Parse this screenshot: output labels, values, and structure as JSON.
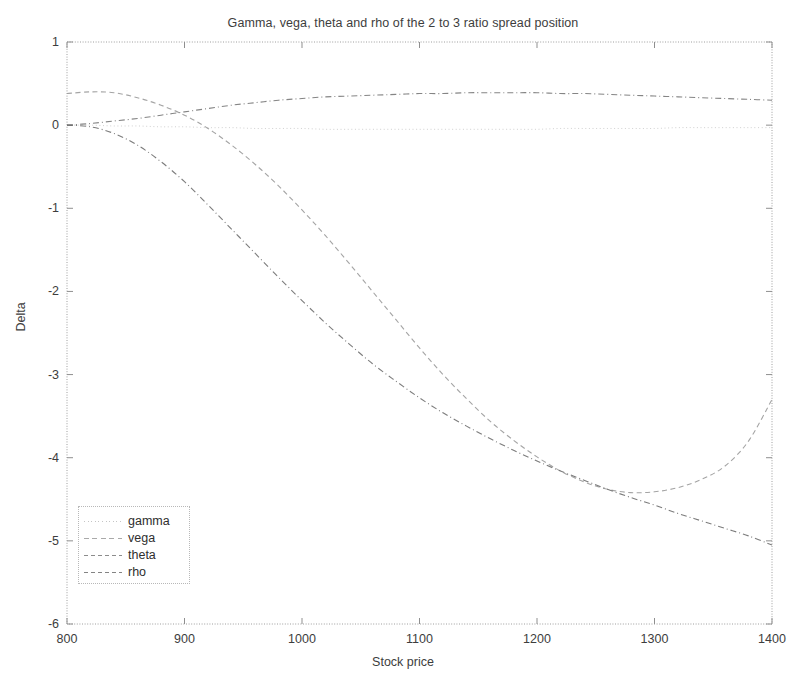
{
  "chart_data": {
    "type": "line",
    "title": "Gamma, vega, theta and rho of the 2 to 3 ratio spread position",
    "xlabel": "Stock price",
    "ylabel": "Delta",
    "xlim": [
      800,
      1400
    ],
    "ylim": [
      -6,
      1
    ],
    "xticks": [
      800,
      900,
      1000,
      1100,
      1200,
      1300,
      1400
    ],
    "yticks": [
      1,
      0,
      -1,
      -2,
      -3,
      -4,
      -5,
      -6
    ],
    "grid": false,
    "legend_position": "lower left",
    "x": [
      800,
      820,
      840,
      860,
      880,
      900,
      920,
      940,
      960,
      980,
      1000,
      1020,
      1040,
      1060,
      1080,
      1100,
      1120,
      1140,
      1160,
      1180,
      1200,
      1220,
      1240,
      1260,
      1280,
      1300,
      1320,
      1340,
      1360,
      1380,
      1400
    ],
    "series": [
      {
        "name": "gamma",
        "style": "dotted",
        "color": "#8a8a8a",
        "values": [
          0.0,
          0.0,
          -0.01,
          -0.01,
          -0.02,
          -0.02,
          -0.03,
          -0.03,
          -0.04,
          -0.04,
          -0.04,
          -0.05,
          -0.05,
          -0.05,
          -0.05,
          -0.05,
          -0.05,
          -0.05,
          -0.05,
          -0.05,
          -0.05,
          -0.04,
          -0.04,
          -0.04,
          -0.04,
          -0.04,
          -0.03,
          -0.03,
          -0.03,
          -0.03,
          -0.03
        ]
      },
      {
        "name": "vega",
        "style": "dashed",
        "color": "#9a9a9a",
        "values": [
          0.38,
          0.4,
          0.39,
          0.33,
          0.24,
          0.12,
          -0.04,
          -0.24,
          -0.47,
          -0.73,
          -1.02,
          -1.33,
          -1.66,
          -2.0,
          -2.34,
          -2.68,
          -3.0,
          -3.29,
          -3.56,
          -3.79,
          -3.99,
          -4.16,
          -4.29,
          -4.38,
          -4.42,
          -4.41,
          -4.36,
          -4.26,
          -4.1,
          -3.8,
          -3.3
        ]
      },
      {
        "name": "theta",
        "style": "dash-dot",
        "color": "#787878",
        "values": [
          0.0,
          0.02,
          0.05,
          0.08,
          0.12,
          0.16,
          0.2,
          0.24,
          0.27,
          0.3,
          0.32,
          0.34,
          0.35,
          0.36,
          0.37,
          0.38,
          0.38,
          0.39,
          0.39,
          0.39,
          0.39,
          0.38,
          0.38,
          0.37,
          0.36,
          0.35,
          0.34,
          0.33,
          0.32,
          0.31,
          0.3
        ]
      },
      {
        "name": "rho",
        "style": "dash-dot",
        "color": "#6e6e6e",
        "values": [
          0.0,
          -0.02,
          -0.1,
          -0.24,
          -0.44,
          -0.68,
          -0.96,
          -1.25,
          -1.54,
          -1.83,
          -2.11,
          -2.38,
          -2.63,
          -2.87,
          -3.08,
          -3.28,
          -3.46,
          -3.62,
          -3.77,
          -3.91,
          -4.04,
          -4.16,
          -4.27,
          -4.38,
          -4.48,
          -4.57,
          -4.67,
          -4.76,
          -4.85,
          -4.94,
          -5.05
        ]
      }
    ]
  },
  "axes": {
    "x_tick_labels": [
      "800",
      "900",
      "1000",
      "1100",
      "1200",
      "1300",
      "1400"
    ],
    "y_tick_labels": [
      "1",
      "0",
      "-1",
      "-2",
      "-3",
      "-4",
      "-5",
      "-6"
    ]
  },
  "legend": {
    "items": [
      {
        "label": "gamma"
      },
      {
        "label": "vega"
      },
      {
        "label": "theta"
      },
      {
        "label": "rho"
      }
    ]
  }
}
